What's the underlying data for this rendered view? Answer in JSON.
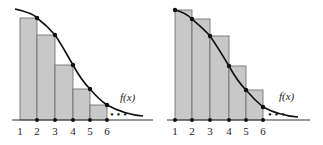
{
  "figure": {
    "panels": [
      {
        "name": "right-endpoint-rectangles",
        "function_label": "f(x)",
        "x_ticks": [
          "1",
          "2",
          "3",
          "4",
          "5",
          "6"
        ],
        "ellipsis": "• • •"
      },
      {
        "name": "left-endpoint-rectangles",
        "function_label": "f(x)",
        "x_ticks": [
          "1",
          "2",
          "3",
          "4",
          "5",
          "6"
        ],
        "ellipsis": "• • •"
      }
    ],
    "colors": {
      "bar_fill": "#c8c8c8",
      "bar_stroke": "#555555",
      "curve": "#111111",
      "axis": "#333333"
    }
  }
}
